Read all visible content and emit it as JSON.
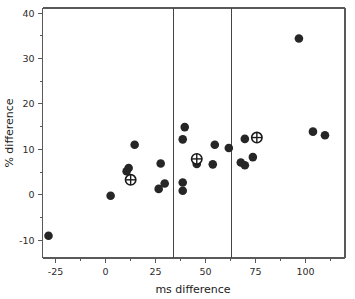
{
  "chart_data": {
    "type": "scatter",
    "title": "",
    "xlabel": "ms difference",
    "ylabel": "% difference",
    "xlim": [
      -31,
      120
    ],
    "ylim": [
      -14,
      41
    ],
    "grid": false,
    "legend": null,
    "x_ticks": [
      -25,
      0,
      25,
      50,
      75,
      100
    ],
    "x_tick_labels": [
      "-25",
      "0",
      "25",
      "50",
      "75",
      "100"
    ],
    "x_minor_ticks": [
      -12.5,
      12.5,
      37.5,
      62.5,
      87.5,
      112.5
    ],
    "y_ticks": [
      -10,
      0,
      10,
      20,
      30,
      40
    ],
    "y_tick_labels": [
      "-10",
      "0",
      "10",
      "20",
      "30",
      "40"
    ],
    "y_minor_ticks": [
      -5,
      5,
      15,
      25,
      35
    ],
    "annotations": [
      {
        "name": "vertical-reference-line-1",
        "type": "vline",
        "x": 34
      },
      {
        "name": "vertical-reference-line-2",
        "type": "vline",
        "x": 63
      }
    ],
    "series": [
      {
        "name": "individual observations",
        "marker": "filled-circle",
        "color": "#262626",
        "points": [
          {
            "x": -28,
            "y": -9.1
          },
          {
            "x": 3,
            "y": -0.3
          },
          {
            "x": 11,
            "y": 5.1
          },
          {
            "x": 12,
            "y": 5.8
          },
          {
            "x": 15,
            "y": 10.9
          },
          {
            "x": 27,
            "y": 1.2
          },
          {
            "x": 28,
            "y": 6.8
          },
          {
            "x": 30,
            "y": 2.4
          },
          {
            "x": 39,
            "y": 0.8
          },
          {
            "x": 39,
            "y": 2.6
          },
          {
            "x": 39,
            "y": 12.1
          },
          {
            "x": 40,
            "y": 14.8
          },
          {
            "x": 46,
            "y": 6.7
          },
          {
            "x": 54,
            "y": 6.6
          },
          {
            "x": 55,
            "y": 10.9
          },
          {
            "x": 62,
            "y": 10.2
          },
          {
            "x": 68,
            "y": 7.0
          },
          {
            "x": 70,
            "y": 6.4
          },
          {
            "x": 70,
            "y": 12.2
          },
          {
            "x": 74,
            "y": 8.2
          },
          {
            "x": 97,
            "y": 34.3
          },
          {
            "x": 104,
            "y": 13.8
          },
          {
            "x": 110,
            "y": 13.0
          }
        ]
      },
      {
        "name": "group means",
        "marker": "crosshair-circle",
        "color": "#1a1a1a",
        "points": [
          {
            "x": 13,
            "y": 3.2
          },
          {
            "x": 46,
            "y": 7.8
          },
          {
            "x": 76,
            "y": 12.5
          }
        ]
      }
    ]
  }
}
